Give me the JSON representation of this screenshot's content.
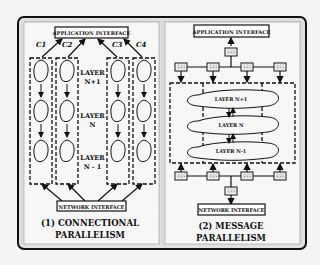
{
  "panels": [
    {
      "id": "connectional",
      "top_box": "APPLICATION INTERFACE",
      "bottom_box": "NETWORK INTERFACE",
      "connections": [
        "C1",
        "C2",
        "C3",
        "C4"
      ],
      "layers": [
        {
          "line1": "LAYER",
          "line2": "N+1"
        },
        {
          "line1": "LAYER",
          "line2": "N"
        },
        {
          "line1": "LAYER",
          "line2": "N - 1"
        }
      ],
      "caption_line1": "(1) CONNECTIONAL",
      "caption_line2": "PARALLELISM"
    },
    {
      "id": "message",
      "top_box": "APPLICATION INTERFACE",
      "bottom_box": "NETWORK INTERFACE",
      "layers": [
        "LAYER N+1",
        "LAYER N",
        "LAYER N-1"
      ],
      "caption_line1": "(2) MESSAGE",
      "caption_line2": "PARALLELISM"
    }
  ],
  "colors": {
    "background": "#f4f4f4",
    "frame_fill": "#e6e6e6",
    "panel_fill": "#f7f7f7",
    "ink": "#111111"
  }
}
